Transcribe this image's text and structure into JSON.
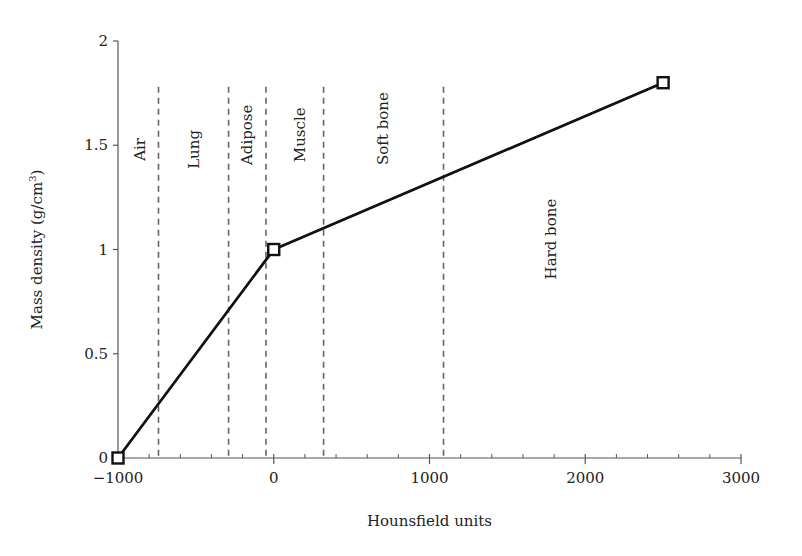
{
  "chart_data": {
    "type": "line",
    "title": "",
    "xlabel": "Hounsfield units",
    "ylabel": "Mass density (g/cm",
    "ylabel_superscript": "3",
    "ylabel_suffix": ")",
    "xlim": [
      -1000,
      3000
    ],
    "ylim": [
      0,
      2
    ],
    "x_ticks": [
      -1000,
      0,
      1000,
      2000,
      3000
    ],
    "x_tick_labels": [
      "−1000",
      "0",
      "1000",
      "2000",
      "3000"
    ],
    "x_minor_step": 200,
    "y_ticks": [
      0,
      0.5,
      1,
      1.5,
      2
    ],
    "y_tick_labels": [
      "0",
      "0.5",
      "1",
      "1.5",
      "2"
    ],
    "grid": false,
    "legend": null,
    "series": [
      {
        "name": "HU to mass density calibration",
        "x": [
          -1000,
          0,
          2500
        ],
        "y": [
          0,
          1.0,
          1.8
        ],
        "marker": "square",
        "color": "#111111"
      }
    ],
    "region_boundaries": [
      -740,
      -290,
      -50,
      320,
      1090
    ],
    "region_boundary_top": 1.78,
    "regions": [
      {
        "label": "Air",
        "x_center": -860,
        "y_center": 1.48
      },
      {
        "label": "Lung",
        "x_center": -510,
        "y_center": 1.48
      },
      {
        "label": "Adipose",
        "x_center": -170,
        "y_center": 1.55
      },
      {
        "label": "Muscle",
        "x_center": 170,
        "y_center": 1.55
      },
      {
        "label": "Soft bone",
        "x_center": 700,
        "y_center": 1.58
      },
      {
        "label": "Hard bone",
        "x_center": 1780,
        "y_center": 1.05
      }
    ]
  },
  "colors": {
    "line": "#111111",
    "axis": "#555555",
    "dashed": "#666666",
    "text": "#222222"
  }
}
